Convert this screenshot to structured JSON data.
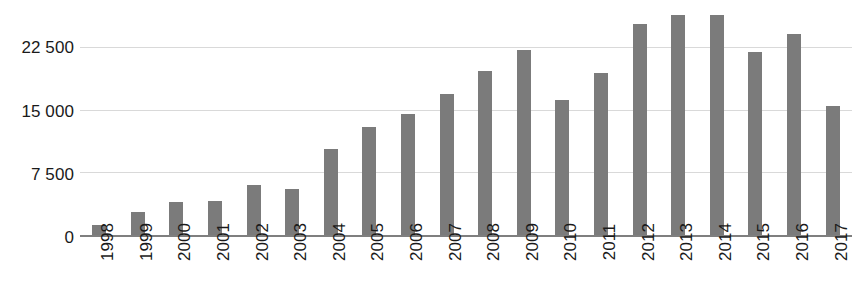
{
  "chart_data": {
    "type": "bar",
    "title": "",
    "subtitle": "",
    "xlabel": "",
    "ylabel": "",
    "categories": [
      "1998",
      "1999",
      "2000",
      "2001",
      "2002",
      "2003",
      "2004",
      "2005",
      "2006",
      "2007",
      "2008",
      "2009",
      "2010",
      "2011",
      "2012",
      "2013",
      "2014",
      "2015",
      "2016",
      "2017"
    ],
    "values": [
      1300,
      2900,
      4000,
      4100,
      6000,
      5600,
      10300,
      12900,
      14500,
      16800,
      19600,
      22100,
      16100,
      19300,
      25200,
      26200,
      26200,
      21800,
      23900,
      15400
    ],
    "series": [
      {
        "name": "",
        "values": [
          1300,
          2900,
          4000,
          4100,
          6000,
          5600,
          10300,
          12900,
          14500,
          16800,
          19600,
          22100,
          16100,
          19300,
          25200,
          26200,
          26200,
          21800,
          23900,
          15400
        ]
      }
    ],
    "ylim": [
      0,
      26800
    ],
    "y_ticks": [
      0,
      7500,
      15000,
      22500
    ],
    "y_tick_labels": [
      "0",
      "7 500",
      "15 000",
      "22 500"
    ],
    "grid": true,
    "grid_axis": "y",
    "legend": false,
    "legend_position": "none",
    "bar_color": "#7b7b7b",
    "gridline_color": "#d9d9d9",
    "axis_color": "#7f7f7f",
    "text_color": "#1a1a1a",
    "background_color": "#ffffff",
    "x_tick_label_rotation": "90"
  }
}
